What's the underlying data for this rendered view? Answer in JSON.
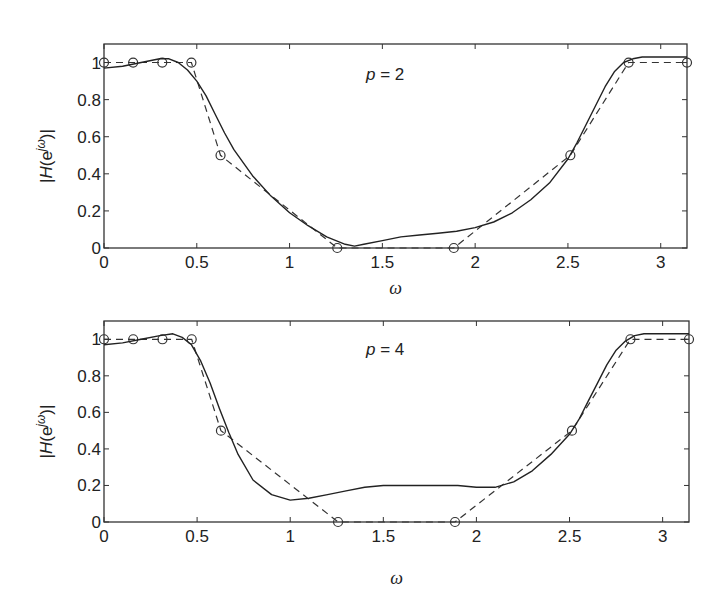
{
  "chart_data": [
    {
      "type": "line",
      "title": "",
      "annotation": "p = 2",
      "annotation_var": "p",
      "annotation_val": "= 2",
      "xlabel": "ω",
      "ylabel": "|H(e^{jω})|",
      "xlim": [
        0,
        3.1416
      ],
      "ylim": [
        0,
        1.1
      ],
      "xticks": [
        0,
        0.5,
        1,
        1.5,
        2,
        2.5,
        3
      ],
      "xtick_labels": [
        "0",
        "0.5",
        "1",
        "1.5",
        "2",
        "2.5",
        "3"
      ],
      "yticks": [
        0,
        0.2,
        0.4,
        0.6,
        0.8,
        1
      ],
      "ytick_labels": [
        "0",
        "0.2",
        "0.4",
        "0.6",
        "0.8",
        "1"
      ],
      "grid": false,
      "series": [
        {
          "name": "desired (samples)",
          "style": "dashed-with-circles",
          "x": [
            0,
            0.157,
            0.314,
            0.471,
            0.628,
            1.257,
            1.885,
            2.513,
            2.827,
            3.1416
          ],
          "y": [
            1,
            1,
            1,
            1,
            0.5,
            0,
            0,
            0.5,
            1,
            1
          ]
        },
        {
          "name": "designed response",
          "style": "solid",
          "x": [
            0,
            0.1,
            0.2,
            0.3,
            0.35,
            0.4,
            0.45,
            0.5,
            0.55,
            0.6,
            0.65,
            0.7,
            0.8,
            0.9,
            1.0,
            1.1,
            1.2,
            1.3,
            1.35,
            1.4,
            1.5,
            1.6,
            1.7,
            1.8,
            1.9,
            2.0,
            2.1,
            2.2,
            2.3,
            2.4,
            2.5,
            2.55,
            2.6,
            2.65,
            2.7,
            2.75,
            2.8,
            2.85,
            2.9,
            3.0,
            3.1416
          ],
          "y": [
            0.97,
            0.98,
            1.0,
            1.02,
            1.02,
            1.0,
            0.96,
            0.9,
            0.82,
            0.72,
            0.62,
            0.53,
            0.39,
            0.28,
            0.19,
            0.12,
            0.06,
            0.02,
            0.01,
            0.02,
            0.04,
            0.06,
            0.07,
            0.08,
            0.09,
            0.11,
            0.14,
            0.19,
            0.26,
            0.35,
            0.48,
            0.57,
            0.67,
            0.77,
            0.87,
            0.95,
            1.0,
            1.02,
            1.03,
            1.03,
            1.03
          ]
        }
      ]
    },
    {
      "type": "line",
      "title": "",
      "annotation": "p = 4",
      "annotation_var": "p",
      "annotation_val": "= 4",
      "xlabel": "ω",
      "ylabel": "|H(e^{jω})|",
      "xlim": [
        0,
        3.1416
      ],
      "ylim": [
        0,
        1.1
      ],
      "xticks": [
        0,
        0.5,
        1,
        1.5,
        2,
        2.5,
        3
      ],
      "xtick_labels": [
        "0",
        "0.5",
        "1",
        "1.5",
        "2",
        "2.5",
        "3"
      ],
      "yticks": [
        0,
        0.2,
        0.4,
        0.6,
        0.8,
        1
      ],
      "ytick_labels": [
        "0",
        "0.2",
        "0.4",
        "0.6",
        "0.8",
        "1"
      ],
      "grid": false,
      "series": [
        {
          "name": "desired (samples)",
          "style": "dashed-with-circles",
          "x": [
            0,
            0.157,
            0.314,
            0.471,
            0.628,
            1.257,
            1.885,
            2.513,
            2.827,
            3.1416
          ],
          "y": [
            1,
            1,
            1,
            1,
            0.5,
            0,
            0,
            0.5,
            1,
            1
          ]
        },
        {
          "name": "designed response",
          "style": "solid",
          "x": [
            0,
            0.1,
            0.2,
            0.3,
            0.37,
            0.42,
            0.47,
            0.52,
            0.57,
            0.62,
            0.67,
            0.72,
            0.8,
            0.9,
            1.0,
            1.1,
            1.2,
            1.3,
            1.4,
            1.5,
            1.6,
            1.7,
            1.8,
            1.9,
            2.0,
            2.1,
            2.2,
            2.3,
            2.4,
            2.5,
            2.55,
            2.6,
            2.65,
            2.7,
            2.75,
            2.8,
            2.85,
            2.9,
            3.0,
            3.1416
          ],
          "y": [
            0.97,
            0.98,
            1.0,
            1.02,
            1.03,
            1.01,
            0.97,
            0.88,
            0.76,
            0.62,
            0.49,
            0.37,
            0.23,
            0.15,
            0.12,
            0.13,
            0.15,
            0.17,
            0.19,
            0.2,
            0.2,
            0.2,
            0.2,
            0.2,
            0.19,
            0.19,
            0.22,
            0.28,
            0.37,
            0.48,
            0.56,
            0.66,
            0.76,
            0.86,
            0.94,
            0.99,
            1.02,
            1.03,
            1.03,
            1.03
          ]
        }
      ]
    }
  ]
}
